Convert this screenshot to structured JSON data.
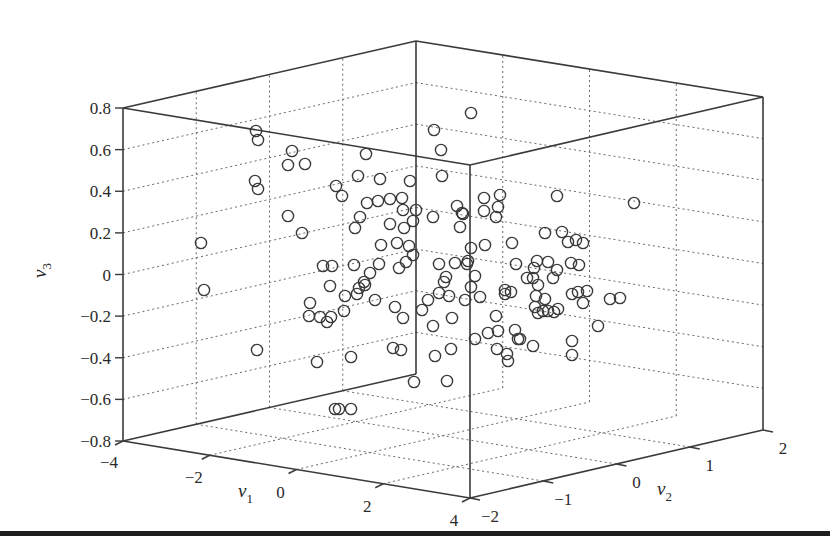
{
  "chart_data": {
    "type": "scatter",
    "projection": "3d",
    "title": "",
    "xlabel": "v1",
    "ylabel": "v2",
    "zlabel": "v3",
    "xlim": [
      -4,
      4
    ],
    "ylim": [
      -2,
      2
    ],
    "zlim": [
      -0.8,
      0.8
    ],
    "x_ticks": [
      "-4",
      "-2",
      "0",
      "2",
      "4"
    ],
    "y_ticks": [
      "-2",
      "-1",
      "0",
      "1",
      "2"
    ],
    "z_ticks": [
      "-0.8",
      "-0.6",
      "-0.4",
      "-0.2",
      "0",
      "0.2",
      "0.4",
      "0.6",
      "0.8"
    ],
    "grid": true,
    "marker": "open-circle",
    "marker_color": "#3a3a3a",
    "point_count": 150,
    "projected_points_px": [
      [
        256,
        131
      ],
      [
        258,
        140
      ],
      [
        292,
        151
      ],
      [
        288,
        165
      ],
      [
        305,
        164
      ],
      [
        255,
        181
      ],
      [
        258,
        189
      ],
      [
        288,
        216
      ],
      [
        302,
        233
      ],
      [
        201,
        243
      ],
      [
        204,
        290
      ],
      [
        336,
        186
      ],
      [
        342,
        196
      ],
      [
        366,
        154
      ],
      [
        358,
        176
      ],
      [
        380,
        179
      ],
      [
        410,
        181
      ],
      [
        442,
        176
      ],
      [
        434,
        130
      ],
      [
        441,
        150
      ],
      [
        471,
        113
      ],
      [
        367,
        203
      ],
      [
        378,
        201
      ],
      [
        390,
        199
      ],
      [
        402,
        198
      ],
      [
        403,
        210
      ],
      [
        416,
        210
      ],
      [
        413,
        221
      ],
      [
        360,
        217
      ],
      [
        355,
        228
      ],
      [
        390,
        224
      ],
      [
        404,
        228
      ],
      [
        433,
        217
      ],
      [
        457,
        206
      ],
      [
        463,
        214
      ],
      [
        460,
        227
      ],
      [
        381,
        245
      ],
      [
        397,
        243
      ],
      [
        409,
        246
      ],
      [
        413,
        255
      ],
      [
        471,
        248
      ],
      [
        484,
        198
      ],
      [
        500,
        195
      ],
      [
        484,
        211
      ],
      [
        498,
        207
      ],
      [
        496,
        217
      ],
      [
        557,
        196
      ],
      [
        634,
        203
      ],
      [
        462,
        213
      ],
      [
        485,
        245
      ],
      [
        512,
        243
      ],
      [
        545,
        233
      ],
      [
        562,
        232
      ],
      [
        568,
        242
      ],
      [
        576,
        240
      ],
      [
        583,
        243
      ],
      [
        516,
        264
      ],
      [
        537,
        261
      ],
      [
        534,
        268
      ],
      [
        548,
        262
      ],
      [
        571,
        263
      ],
      [
        557,
        270
      ],
      [
        533,
        278
      ],
      [
        553,
        278
      ],
      [
        579,
        265
      ],
      [
        467,
        264
      ],
      [
        475,
        276
      ],
      [
        471,
        287
      ],
      [
        465,
        300
      ],
      [
        505,
        290
      ],
      [
        527,
        278
      ],
      [
        538,
        285
      ],
      [
        505,
        294
      ],
      [
        511,
        292
      ],
      [
        545,
        299
      ],
      [
        536,
        296
      ],
      [
        535,
        307
      ],
      [
        538,
        313
      ],
      [
        543,
        311
      ],
      [
        548,
        311
      ],
      [
        554,
        312
      ],
      [
        558,
        309
      ],
      [
        572,
        294
      ],
      [
        578,
        292
      ],
      [
        587,
        291
      ],
      [
        583,
        303
      ],
      [
        610,
        299
      ],
      [
        620,
        298
      ],
      [
        598,
        326
      ],
      [
        496,
        316
      ],
      [
        498,
        331
      ],
      [
        488,
        333
      ],
      [
        475,
        339
      ],
      [
        515,
        330
      ],
      [
        518,
        339
      ],
      [
        520,
        339
      ],
      [
        533,
        346
      ],
      [
        497,
        349
      ],
      [
        507,
        354
      ],
      [
        508,
        361
      ],
      [
        572,
        341
      ],
      [
        572,
        355
      ],
      [
        323,
        266
      ],
      [
        332,
        266
      ],
      [
        354,
        265
      ],
      [
        379,
        264
      ],
      [
        406,
        262
      ],
      [
        399,
        268
      ],
      [
        370,
        273
      ],
      [
        364,
        282
      ],
      [
        359,
        288
      ],
      [
        365,
        285
      ],
      [
        357,
        294
      ],
      [
        330,
        286
      ],
      [
        345,
        296
      ],
      [
        310,
        303
      ],
      [
        309,
        316
      ],
      [
        320,
        317
      ],
      [
        331,
        317
      ],
      [
        327,
        322
      ],
      [
        344,
        311
      ],
      [
        375,
        300
      ],
      [
        395,
        307
      ],
      [
        403,
        318
      ],
      [
        422,
        310
      ],
      [
        428,
        300
      ],
      [
        439,
        293
      ],
      [
        439,
        264
      ],
      [
        455,
        263
      ],
      [
        468,
        261
      ],
      [
        444,
        282
      ],
      [
        446,
        277
      ],
      [
        449,
        296
      ],
      [
        480,
        297
      ],
      [
        433,
        326
      ],
      [
        452,
        318
      ],
      [
        393,
        348
      ],
      [
        401,
        350
      ],
      [
        317,
        362
      ],
      [
        351,
        357
      ],
      [
        257,
        350
      ],
      [
        435,
        356
      ],
      [
        451,
        349
      ],
      [
        447,
        381
      ],
      [
        414,
        382
      ],
      [
        335,
        409
      ],
      [
        339,
        409
      ],
      [
        351,
        409
      ]
    ]
  },
  "axes": {
    "z_label": "v",
    "z_sub": "3",
    "x_label": "v",
    "x_sub": "1",
    "y_label": "v",
    "y_sub": "2"
  }
}
